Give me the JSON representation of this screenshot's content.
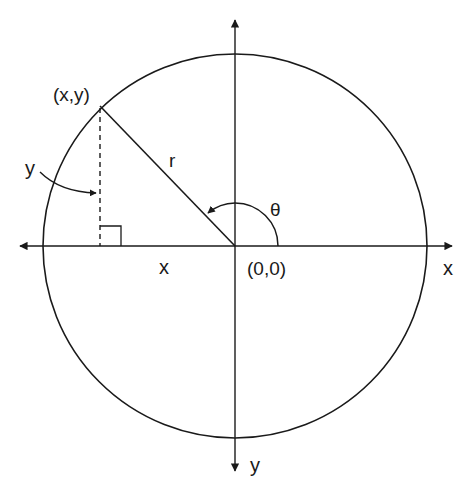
{
  "diagram": {
    "labels": {
      "point": "(x,y)",
      "radius": "r",
      "angle": "θ",
      "origin": "(0,0)",
      "x_axis": "x",
      "y_axis": "y",
      "x_segment": "x",
      "y_segment": "y"
    },
    "geometry": {
      "center": [
        235,
        246
      ],
      "radius": 192,
      "point": [
        100,
        106
      ],
      "angle_arc_radius": 43
    },
    "colors": {
      "stroke": "#1a1a1a",
      "background": "#ffffff"
    }
  }
}
